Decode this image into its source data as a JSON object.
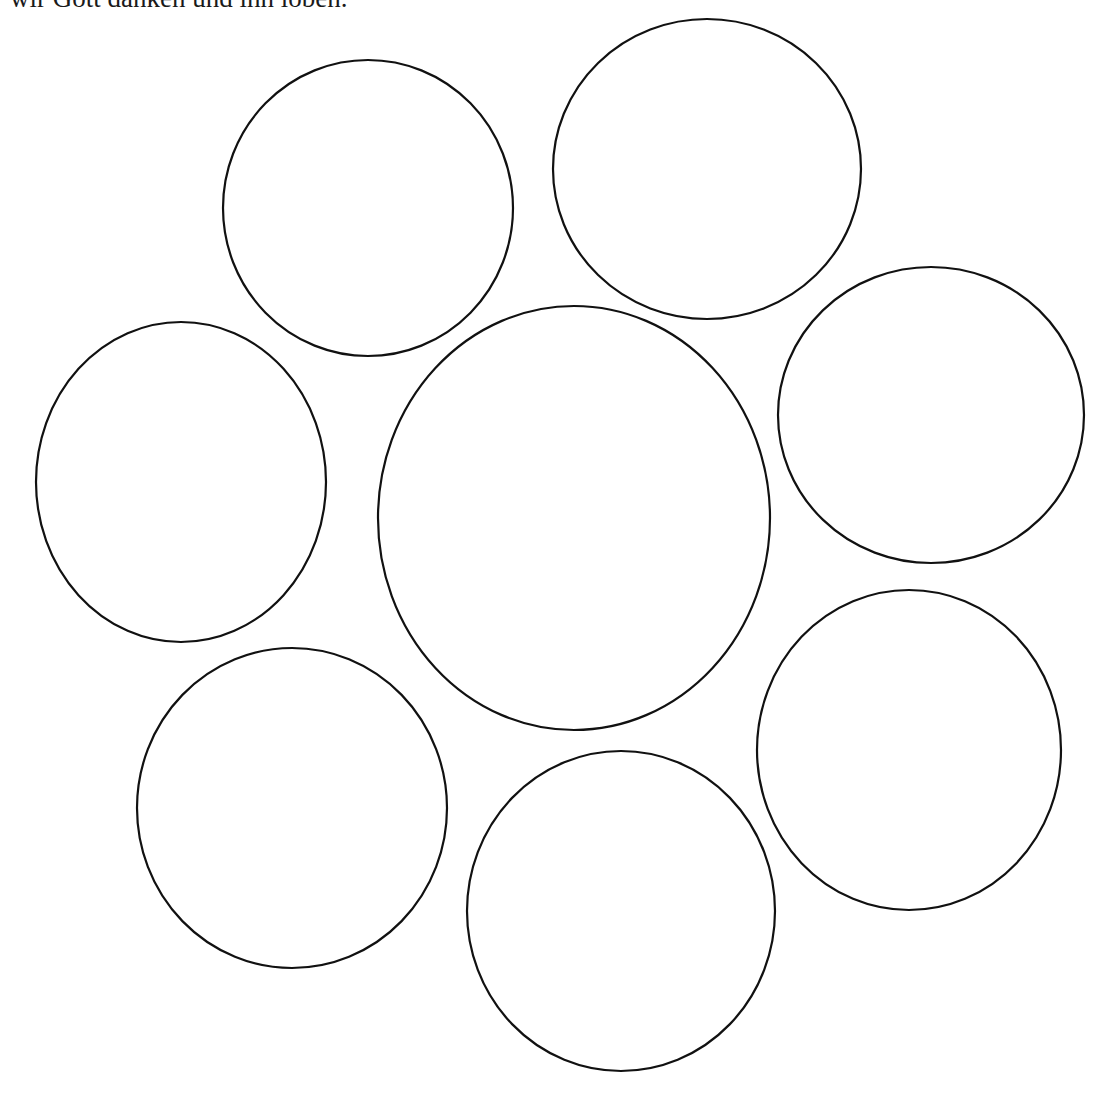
{
  "caption": "wir Gott danken und ihn loben.",
  "stroke_color": "#111111",
  "circles": [
    {
      "name": "circle-top-left",
      "cx": 368,
      "cy": 208,
      "rx": 145,
      "ry": 148
    },
    {
      "name": "circle-top-right",
      "cx": 707,
      "cy": 169,
      "rx": 154,
      "ry": 150
    },
    {
      "name": "circle-left",
      "cx": 181,
      "cy": 482,
      "rx": 145,
      "ry": 160
    },
    {
      "name": "circle-center",
      "cx": 574,
      "cy": 518,
      "rx": 196,
      "ry": 212
    },
    {
      "name": "circle-right",
      "cx": 931,
      "cy": 415,
      "rx": 153,
      "ry": 148
    },
    {
      "name": "circle-bottom-left",
      "cx": 292,
      "cy": 808,
      "rx": 155,
      "ry": 160
    },
    {
      "name": "circle-bottom-center",
      "cx": 621,
      "cy": 911,
      "rx": 154,
      "ry": 160
    },
    {
      "name": "circle-bottom-right",
      "cx": 909,
      "cy": 750,
      "rx": 152,
      "ry": 160
    }
  ]
}
